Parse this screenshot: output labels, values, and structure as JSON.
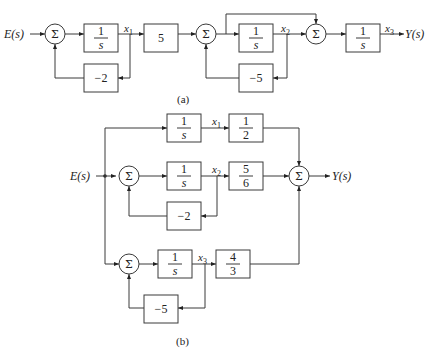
{
  "diagram_a": {
    "caption": "(a)",
    "input_label": "E(s)",
    "output_label": "Y(s)",
    "sum_symbol": "Σ",
    "blocks": {
      "integrator1": {
        "num": "1",
        "den": "s"
      },
      "gain5": {
        "value": "5"
      },
      "feedback1": {
        "value": "−2"
      },
      "integrator2": {
        "num": "1",
        "den": "s"
      },
      "feedback2": {
        "value": "−5"
      },
      "integrator3": {
        "num": "1",
        "den": "s"
      }
    },
    "signals": {
      "x1": {
        "base": "x",
        "sub": "1"
      },
      "x2": {
        "base": "x",
        "sub": "2"
      },
      "x3": {
        "base": "x",
        "sub": "3"
      }
    }
  },
  "diagram_b": {
    "caption": "(b)",
    "input_label": "E(s)",
    "output_label": "Y(s)",
    "sum_symbol": "Σ",
    "blocks": {
      "integrator1": {
        "num": "1",
        "den": "s"
      },
      "gain1": {
        "num": "1",
        "den": "2"
      },
      "integrator2": {
        "num": "1",
        "den": "s"
      },
      "gain2": {
        "num": "5",
        "den": "6"
      },
      "feedback2": {
        "value": "−2"
      },
      "integrator3": {
        "num": "1",
        "den": "s"
      },
      "gain3": {
        "num": "4",
        "den": "3"
      },
      "feedback3": {
        "value": "−5"
      }
    },
    "signals": {
      "x1": {
        "base": "x",
        "sub": "1"
      },
      "x2": {
        "base": "x",
        "sub": "2"
      },
      "x3": {
        "base": "x",
        "sub": "3"
      }
    }
  }
}
